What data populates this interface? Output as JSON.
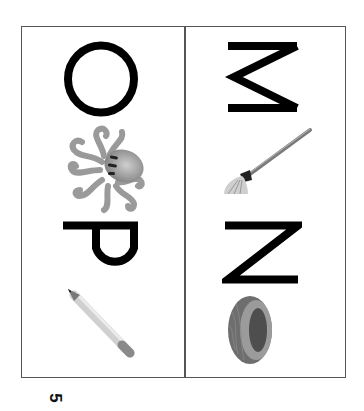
{
  "page": {
    "orientation": "rotated-90",
    "page_number": "5"
  },
  "cards": [
    {
      "column": "left",
      "entries": [
        {
          "letter": "O",
          "picture": "octopus",
          "picture_icon": "octopus-icon"
        },
        {
          "letter": "P",
          "picture": "pencil",
          "picture_icon": "pencil-icon"
        }
      ]
    },
    {
      "column": "right",
      "entries": [
        {
          "letter": "M",
          "picture": "mop",
          "picture_icon": "mop-icon"
        },
        {
          "letter": "N",
          "picture": "nest",
          "picture_icon": "nest-icon"
        }
      ]
    }
  ],
  "colors": {
    "letter": "#000000",
    "border": "#555555",
    "background": "#ffffff",
    "image_gray": "#8a8a8a"
  }
}
